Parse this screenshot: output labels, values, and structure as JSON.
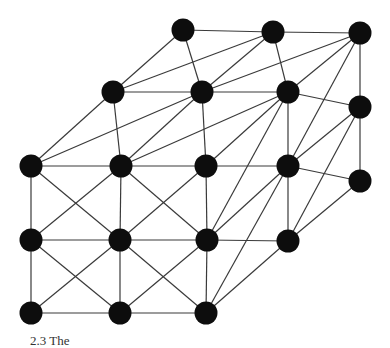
{
  "diagram": {
    "type": "lattice graph (3D box of nodes with diagonal connections)",
    "node_color": "#0d0d0d",
    "edge_color": "#3a3a3a",
    "node_radius": 11.5,
    "nodes": {
      "T0": [
        183,
        30
      ],
      "T1": [
        273,
        32
      ],
      "T2": [
        360,
        33
      ],
      "M0": [
        113,
        92
      ],
      "M1": [
        202,
        92
      ],
      "M2": [
        288,
        92
      ],
      "R0": [
        360,
        107
      ],
      "F00": [
        31,
        166
      ],
      "F01": [
        121,
        166
      ],
      "F02": [
        206,
        166
      ],
      "F03": [
        288,
        166
      ],
      "R1": [
        360,
        181
      ],
      "F10": [
        31,
        240
      ],
      "F11": [
        120,
        240
      ],
      "F12": [
        207,
        240
      ],
      "F13": [
        288,
        241
      ],
      "F20": [
        31,
        313
      ],
      "F21": [
        120,
        313
      ],
      "F22": [
        206,
        313
      ]
    },
    "edges": [
      [
        "T0",
        "T1"
      ],
      [
        "T1",
        "T2"
      ],
      [
        "T2",
        "R0"
      ],
      [
        "R0",
        "R1"
      ],
      [
        "M0",
        "M1"
      ],
      [
        "M1",
        "M2"
      ],
      [
        "M2",
        "R0"
      ],
      [
        "M0",
        "T0"
      ],
      [
        "M0",
        "T1"
      ],
      [
        "M1",
        "T0"
      ],
      [
        "M1",
        "T1"
      ],
      [
        "M1",
        "T2"
      ],
      [
        "M2",
        "T1"
      ],
      [
        "M2",
        "T2"
      ],
      [
        "F00",
        "M0"
      ],
      [
        "F00",
        "M1"
      ],
      [
        "F01",
        "M0"
      ],
      [
        "F01",
        "M1"
      ],
      [
        "F01",
        "M2"
      ],
      [
        "F02",
        "M1"
      ],
      [
        "F02",
        "M2"
      ],
      [
        "F03",
        "M2"
      ],
      [
        "F03",
        "T2"
      ],
      [
        "F03",
        "R0"
      ],
      [
        "F12",
        "M2"
      ],
      [
        "F13",
        "R0"
      ],
      [
        "F03",
        "R1"
      ],
      [
        "F13",
        "R1"
      ],
      [
        "F00",
        "F01"
      ],
      [
        "F01",
        "F02"
      ],
      [
        "F02",
        "F03"
      ],
      [
        "F10",
        "F11"
      ],
      [
        "F11",
        "F12"
      ],
      [
        "F12",
        "F13"
      ],
      [
        "F20",
        "F21"
      ],
      [
        "F21",
        "F22"
      ],
      [
        "F00",
        "F10"
      ],
      [
        "F10",
        "F20"
      ],
      [
        "F01",
        "F11"
      ],
      [
        "F11",
        "F21"
      ],
      [
        "F02",
        "F12"
      ],
      [
        "F12",
        "F22"
      ],
      [
        "F03",
        "F13"
      ],
      [
        "F00",
        "F11"
      ],
      [
        "F01",
        "F10"
      ],
      [
        "F01",
        "F12"
      ],
      [
        "F02",
        "F11"
      ],
      [
        "F10",
        "F21"
      ],
      [
        "F11",
        "F20"
      ],
      [
        "F11",
        "F22"
      ],
      [
        "F12",
        "F21"
      ],
      [
        "F03",
        "F12"
      ],
      [
        "F03",
        "F22"
      ],
      [
        "F13",
        "F22"
      ]
    ]
  },
  "caption": {
    "text": "2.3 The"
  }
}
